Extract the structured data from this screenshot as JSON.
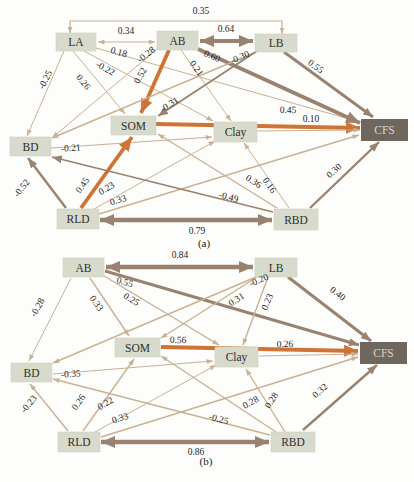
{
  "figure": {
    "colors": {
      "node_bg": "#d8dbcb",
      "node_stroke": "#c8ccba",
      "target_bg": "#6f665e",
      "target_text": "#d9d3cb",
      "orange": "#cf7434",
      "brown": "#9a8270",
      "tan": "#c9b193",
      "label": "#262626",
      "background": "#fdfdfb"
    }
  },
  "panels": [
    {
      "caption": "(a)",
      "caption_x": 204,
      "caption_y": 247,
      "nodes": [
        {
          "id": "LA",
          "label": "LA",
          "x": 56,
          "y": 33,
          "w": 40,
          "h": 18,
          "dark": false
        },
        {
          "id": "AB",
          "label": "AB",
          "x": 157,
          "y": 31,
          "w": 41,
          "h": 19,
          "dark": false
        },
        {
          "id": "LB",
          "label": "LB",
          "x": 255,
          "y": 34,
          "w": 42,
          "h": 18,
          "dark": false
        },
        {
          "id": "SOM",
          "label": "SOM",
          "x": 111,
          "y": 116,
          "w": 45,
          "h": 19,
          "dark": false
        },
        {
          "id": "Clay",
          "label": "Clay",
          "x": 214,
          "y": 122,
          "w": 43,
          "h": 20,
          "dark": false
        },
        {
          "id": "CFS",
          "label": "CFS",
          "x": 361,
          "y": 119,
          "w": 47,
          "h": 22,
          "dark": true
        },
        {
          "id": "BD",
          "label": "BD",
          "x": 10,
          "y": 137,
          "w": 41,
          "h": 19,
          "dark": false
        },
        {
          "id": "RLD",
          "label": "RLD",
          "x": 57,
          "y": 209,
          "w": 42,
          "h": 20,
          "dark": false
        },
        {
          "id": "RBD",
          "label": "RBD",
          "x": 274,
          "y": 209,
          "w": 44,
          "h": 21,
          "dark": false
        }
      ],
      "edges": [
        {
          "from": "LA",
          "to": "LB",
          "label": "0.35",
          "pts": [
            [
              70,
              33
            ],
            [
              70,
              21
            ],
            [
              282,
              21
            ],
            [
              282,
              34
            ]
          ],
          "double": true,
          "c": "tan",
          "w": 1.2,
          "lx": 201,
          "ly": 14,
          "rot": 0
        },
        {
          "from": "LA",
          "to": "AB",
          "label": "0.34",
          "x1": 98,
          "y1": 42,
          "x2": 155,
          "y2": 42,
          "double": true,
          "c": "tan",
          "w": 1.2,
          "lx": 126,
          "ly": 34,
          "rot": 0
        },
        {
          "from": "AB",
          "to": "LB",
          "label": "0.64",
          "x1": 200,
          "y1": 41,
          "x2": 253,
          "y2": 41,
          "double": true,
          "c": "brown",
          "w": 4.2,
          "lx": 226,
          "ly": 32,
          "rot": 0
        },
        {
          "from": "LA",
          "to": "BD",
          "label": "-0.25",
          "x1": 64,
          "y1": 51,
          "x2": 27,
          "y2": 136,
          "c": "tan",
          "w": 1,
          "lx": 48,
          "ly": 81,
          "rot": -63
        },
        {
          "from": "LA",
          "to": "SOM",
          "label": "0.26",
          "x1": 73,
          "y1": 51,
          "x2": 125,
          "y2": 114,
          "c": "tan",
          "w": 1,
          "lx": 81,
          "ly": 84,
          "rot": 51
        },
        {
          "from": "LA",
          "to": "Clay",
          "label": "-0.22",
          "x1": 84,
          "y1": 51,
          "x2": 213,
          "y2": 121,
          "c": "tan",
          "w": 1,
          "lx": 104,
          "ly": 71,
          "rot": 29
        },
        {
          "from": "LA",
          "to": "CFS",
          "label": "0.18",
          "x1": 96,
          "y1": 48,
          "x2": 360,
          "y2": 122,
          "c": "tan",
          "w": 1,
          "lx": 118,
          "ly": 55,
          "rot": 16
        },
        {
          "from": "AB",
          "to": "BD",
          "label": "-0.28",
          "x1": 157,
          "y1": 49,
          "x2": 52,
          "y2": 138,
          "c": "tan",
          "w": 1,
          "lx": 148,
          "ly": 57,
          "rot": -38
        },
        {
          "from": "AB",
          "to": "SOM",
          "label": "0.52",
          "x1": 169,
          "y1": 50,
          "x2": 141,
          "y2": 113,
          "c": "orange",
          "w": 3.8,
          "lx": 143,
          "ly": 77,
          "rot": -62
        },
        {
          "from": "AB",
          "to": "Clay",
          "label": "0.21",
          "x1": 181,
          "y1": 50,
          "x2": 231,
          "y2": 121,
          "c": "tan",
          "w": 1,
          "lx": 194,
          "ly": 70,
          "rot": 55
        },
        {
          "from": "AB",
          "to": "CFS",
          "label": "0.60",
          "x1": 198,
          "y1": 49,
          "x2": 360,
          "y2": 123,
          "c": "brown",
          "w": 3.8,
          "lx": 211,
          "ly": 59,
          "rot": 23
        },
        {
          "from": "LB",
          "to": "BD",
          "label": "-0.30",
          "x1": 256,
          "y1": 52,
          "x2": 52,
          "y2": 138,
          "c": "tan",
          "w": 1.4,
          "lx": 241,
          "ly": 60,
          "rot": -23
        },
        {
          "from": "LB",
          "to": "SOM",
          "label": "-0.31",
          "x1": 257,
          "y1": 51,
          "x2": 158,
          "y2": 116,
          "c": "brown",
          "w": 1.8,
          "lx": 171,
          "ly": 107,
          "rot": -33
        },
        {
          "from": "LB",
          "to": "CFS",
          "label": "0.55",
          "x1": 284,
          "y1": 52,
          "x2": 373,
          "y2": 117,
          "c": "brown",
          "w": 2.8,
          "lx": 314,
          "ly": 69,
          "rot": 36
        },
        {
          "from": "SOM",
          "to": "CFS",
          "label": "0.45",
          "x1": 156,
          "y1": 124,
          "x2": 360,
          "y2": 128,
          "c": "orange",
          "w": 3.8,
          "lx": 288,
          "ly": 113,
          "rot": 1
        },
        {
          "from": "Clay",
          "to": "CFS",
          "label": "0.10",
          "x1": 257,
          "y1": 131,
          "x2": 360,
          "y2": 130,
          "c": "tan",
          "w": 1,
          "lx": 311,
          "ly": 122,
          "rot": 0
        },
        {
          "from": "BD",
          "to": "Clay",
          "label": "-0.21",
          "x1": 51,
          "y1": 148,
          "x2": 212,
          "y2": 137,
          "c": "tan",
          "w": 1,
          "lx": 71,
          "ly": 151,
          "rot": -4
        },
        {
          "from": "RLD",
          "to": "BD",
          "label": "-0.52",
          "x1": 66,
          "y1": 208,
          "x2": 28,
          "y2": 158,
          "c": "brown",
          "w": 2.4,
          "lx": 24,
          "ly": 190,
          "rot": -52
        },
        {
          "from": "RLD",
          "to": "SOM",
          "label": "0.45",
          "x1": 81,
          "y1": 208,
          "x2": 132,
          "y2": 137,
          "c": "orange",
          "w": 3.8,
          "lx": 85,
          "ly": 187,
          "rot": -54
        },
        {
          "from": "RLD",
          "to": "Clay",
          "label": "0.23",
          "x1": 94,
          "y1": 209,
          "x2": 215,
          "y2": 141,
          "c": "tan",
          "w": 1,
          "lx": 108,
          "ly": 191,
          "rot": -30
        },
        {
          "from": "RLD",
          "to": "CFS",
          "label": "0.33",
          "x1": 99,
          "y1": 214,
          "x2": 359,
          "y2": 135,
          "c": "tan",
          "w": 1.4,
          "lx": 119,
          "ly": 203,
          "rot": -17
        },
        {
          "from": "RLD",
          "to": "RBD",
          "label": "0.79",
          "x1": 100,
          "y1": 220,
          "x2": 272,
          "y2": 220,
          "double": true,
          "c": "brown",
          "w": 4.6,
          "lx": 197,
          "ly": 234,
          "rot": 0
        },
        {
          "from": "RBD",
          "to": "BD",
          "label": "-0.49",
          "x1": 273,
          "y1": 212,
          "x2": 52,
          "y2": 157,
          "c": "brown",
          "w": 1.8,
          "lx": 228,
          "ly": 200,
          "rot": 14
        },
        {
          "from": "RBD",
          "to": "SOM",
          "label": "0.36",
          "x1": 277,
          "y1": 208,
          "x2": 158,
          "y2": 134,
          "c": "tan",
          "w": 1.4,
          "lx": 252,
          "ly": 184,
          "rot": 32
        },
        {
          "from": "RBD",
          "to": "Clay",
          "label": "0.16",
          "x1": 289,
          "y1": 208,
          "x2": 244,
          "y2": 143,
          "c": "tan",
          "w": 1,
          "lx": 267,
          "ly": 187,
          "rot": 55
        },
        {
          "from": "RBD",
          "to": "CFS",
          "label": "0.30",
          "x1": 310,
          "y1": 208,
          "x2": 379,
          "y2": 142,
          "c": "brown",
          "w": 2.4,
          "lx": 336,
          "ly": 173,
          "rot": -42
        }
      ]
    },
    {
      "caption": "(b)",
      "caption_x": 206,
      "caption_y": 465,
      "nodes": [
        {
          "id": "AB",
          "label": "AB",
          "x": 63,
          "y": 258,
          "w": 41,
          "h": 19,
          "dark": false
        },
        {
          "id": "LB",
          "label": "LB",
          "x": 255,
          "y": 258,
          "w": 42,
          "h": 19,
          "dark": false
        },
        {
          "id": "SOM",
          "label": "SOM",
          "x": 115,
          "y": 338,
          "w": 45,
          "h": 19,
          "dark": false
        },
        {
          "id": "Clay",
          "label": "Clay",
          "x": 215,
          "y": 347,
          "w": 43,
          "h": 20,
          "dark": false
        },
        {
          "id": "CFS",
          "label": "CFS",
          "x": 360,
          "y": 342,
          "w": 47,
          "h": 22,
          "dark": true
        },
        {
          "id": "BD",
          "label": "BD",
          "x": 11,
          "y": 363,
          "w": 41,
          "h": 19,
          "dark": false
        },
        {
          "id": "RLD",
          "label": "RLD",
          "x": 58,
          "y": 432,
          "w": 42,
          "h": 20,
          "dark": false
        },
        {
          "id": "RBD",
          "label": "RBD",
          "x": 271,
          "y": 432,
          "w": 44,
          "h": 20,
          "dark": false
        }
      ],
      "edges": [
        {
          "from": "AB",
          "to": "LB",
          "label": "0.84",
          "x1": 106,
          "y1": 267,
          "x2": 253,
          "y2": 267,
          "double": true,
          "c": "brown",
          "w": 4.4,
          "lx": 180,
          "ly": 258,
          "rot": 0
        },
        {
          "from": "AB",
          "to": "BD",
          "label": "-0.28",
          "x1": 71,
          "y1": 278,
          "x2": 29,
          "y2": 361,
          "c": "tan",
          "w": 1,
          "lx": 40,
          "ly": 309,
          "rot": -60
        },
        {
          "from": "AB",
          "to": "SOM",
          "label": "0.33",
          "x1": 90,
          "y1": 278,
          "x2": 129,
          "y2": 336,
          "c": "tan",
          "w": 1.4,
          "lx": 94,
          "ly": 305,
          "rot": 55
        },
        {
          "from": "AB",
          "to": "Clay",
          "label": "0.25",
          "x1": 104,
          "y1": 276,
          "x2": 219,
          "y2": 345,
          "c": "tan",
          "w": 1.4,
          "lx": 130,
          "ly": 302,
          "rot": 30
        },
        {
          "from": "AB",
          "to": "CFS",
          "label": "0.55",
          "x1": 105,
          "y1": 271,
          "x2": 359,
          "y2": 345,
          "c": "brown",
          "w": 3,
          "lx": 124,
          "ly": 285,
          "rot": 16
        },
        {
          "from": "LB",
          "to": "BD",
          "label": "-0.20",
          "x1": 256,
          "y1": 277,
          "x2": 53,
          "y2": 363,
          "c": "tan",
          "w": 1.4,
          "lx": 260,
          "ly": 283,
          "rot": -23
        },
        {
          "from": "LB",
          "to": "SOM",
          "label": "0.31",
          "x1": 257,
          "y1": 277,
          "x2": 161,
          "y2": 338,
          "c": "tan",
          "w": 1.4,
          "lx": 238,
          "ly": 302,
          "rot": -33
        },
        {
          "from": "LB",
          "to": "Clay",
          "label": "0.23",
          "x1": 268,
          "y1": 277,
          "x2": 243,
          "y2": 345,
          "c": "tan",
          "w": 1.4,
          "lx": 270,
          "ly": 303,
          "rot": -67
        },
        {
          "from": "LB",
          "to": "CFS",
          "label": "0.40",
          "x1": 288,
          "y1": 277,
          "x2": 371,
          "y2": 341,
          "c": "brown",
          "w": 3,
          "lx": 336,
          "ly": 296,
          "rot": 37
        },
        {
          "from": "SOM",
          "to": "CFS",
          "label": "0.56",
          "x1": 161,
          "y1": 347,
          "x2": 358,
          "y2": 351,
          "c": "orange",
          "w": 3.8,
          "lx": 178,
          "ly": 343,
          "rot": 1
        },
        {
          "from": "Clay",
          "to": "CFS",
          "label": "0.26",
          "x1": 259,
          "y1": 356,
          "x2": 358,
          "y2": 354,
          "c": "tan",
          "w": 1,
          "lx": 285,
          "ly": 347,
          "rot": -1
        },
        {
          "from": "BD",
          "to": "Clay",
          "label": "-0.35",
          "x1": 53,
          "y1": 374,
          "x2": 213,
          "y2": 361,
          "c": "tan",
          "w": 1,
          "lx": 71,
          "ly": 377,
          "rot": -4
        },
        {
          "from": "RLD",
          "to": "BD",
          "label": "-0.23",
          "x1": 68,
          "y1": 431,
          "x2": 30,
          "y2": 384,
          "c": "tan",
          "w": 1.4,
          "lx": 31,
          "ly": 406,
          "rot": -50
        },
        {
          "from": "RLD",
          "to": "SOM",
          "label": "0.26",
          "x1": 83,
          "y1": 431,
          "x2": 134,
          "y2": 359,
          "c": "tan",
          "w": 1.4,
          "lx": 81,
          "ly": 404,
          "rot": -54
        },
        {
          "from": "RLD",
          "to": "Clay",
          "label": "0.22",
          "x1": 95,
          "y1": 432,
          "x2": 216,
          "y2": 365,
          "c": "tan",
          "w": 1,
          "lx": 107,
          "ly": 406,
          "rot": -30
        },
        {
          "from": "RLD",
          "to": "CFS",
          "label": "0.33",
          "x1": 101,
          "y1": 437,
          "x2": 358,
          "y2": 357,
          "c": "tan",
          "w": 1.4,
          "lx": 121,
          "ly": 421,
          "rot": -17
        },
        {
          "from": "RLD",
          "to": "RBD",
          "label": "0.86",
          "x1": 101,
          "y1": 442,
          "x2": 269,
          "y2": 442,
          "double": true,
          "c": "brown",
          "w": 4.6,
          "lx": 196,
          "ly": 455,
          "rot": 0
        },
        {
          "from": "RBD",
          "to": "BD",
          "label": "-0.25",
          "x1": 270,
          "y1": 435,
          "x2": 53,
          "y2": 379,
          "c": "tan",
          "w": 1.4,
          "lx": 218,
          "ly": 422,
          "rot": 14
        },
        {
          "from": "RBD",
          "to": "SOM",
          "label": "0.28",
          "x1": 276,
          "y1": 432,
          "x2": 161,
          "y2": 356,
          "c": "tan",
          "w": 1.4,
          "lx": 252,
          "ly": 405,
          "rot": -28
        },
        {
          "from": "RBD",
          "to": "Clay",
          "label": "0.28",
          "x1": 285,
          "y1": 432,
          "x2": 246,
          "y2": 369,
          "c": "tan",
          "w": 1.4,
          "lx": 274,
          "ly": 402,
          "rot": -57
        },
        {
          "from": "RBD",
          "to": "CFS",
          "label": "0.32",
          "x1": 303,
          "y1": 430,
          "x2": 377,
          "y2": 365,
          "c": "brown",
          "w": 2.4,
          "lx": 322,
          "ly": 393,
          "rot": -42
        }
      ]
    }
  ]
}
